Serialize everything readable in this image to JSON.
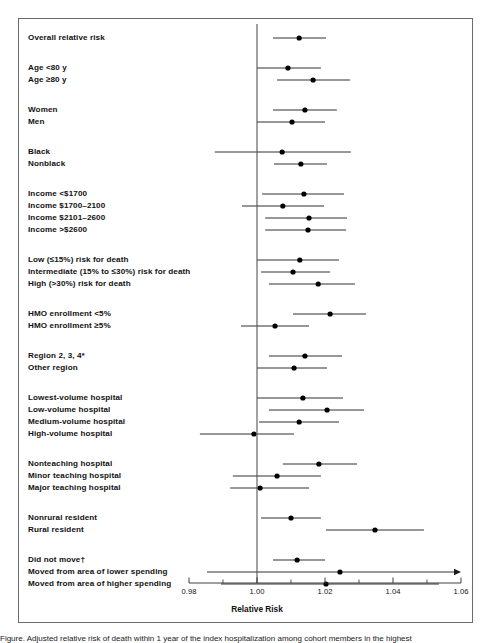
{
  "figure": {
    "x_axis_title": "Relative Risk",
    "x_ticks": [
      "0.98",
      "1.00",
      "1.02",
      "1.04",
      "1.06"
    ],
    "x_tick_values": [
      0.98,
      1.0,
      1.02,
      1.04,
      1.06
    ],
    "x_minor_ticks": [
      0.99,
      1.01,
      1.03,
      1.05
    ],
    "reference_line": 1.0,
    "caption_partial": "Figure. Adjusted relative risk of death within 1 year of the index hospitalization among cohort members in the highest"
  },
  "chart_data": {
    "type": "forest",
    "title": "",
    "xlabel": "Relative Risk",
    "ylabel": "",
    "xlim": [
      0.98,
      1.06
    ],
    "grid": false,
    "reference_line": 1.0,
    "measure": "Relative Risk",
    "groups": [
      {
        "name": "overall",
        "rows": [
          {
            "label": "Overall relative risk",
            "rr": 1.0124,
            "ci_low": 1.0047,
            "ci_high": 1.0203,
            "arrow_right": false
          }
        ]
      },
      {
        "name": "age",
        "rows": [
          {
            "label": "Age <80 y",
            "rr": 1.0091,
            "ci_low": 1.0,
            "ci_high": 1.0188,
            "arrow_right": false
          },
          {
            "label": "Age ≥80 y",
            "rr": 1.0165,
            "ci_low": 1.0059,
            "ci_high": 1.0274,
            "arrow_right": false
          }
        ]
      },
      {
        "name": "sex",
        "rows": [
          {
            "label": "Women",
            "rr": 1.0141,
            "ci_low": 1.0047,
            "ci_high": 1.0235,
            "arrow_right": false
          },
          {
            "label": "Men",
            "rr": 1.0103,
            "ci_low": 1.0,
            "ci_high": 1.02,
            "arrow_right": false
          }
        ]
      },
      {
        "name": "race",
        "rows": [
          {
            "label": "Black",
            "rr": 1.0074,
            "ci_low": 0.9876,
            "ci_high": 1.0276,
            "arrow_right": false
          },
          {
            "label": "Nonblack",
            "rr": 1.0129,
            "ci_low": 1.005,
            "ci_high": 1.0206,
            "arrow_right": false
          }
        ]
      },
      {
        "name": "income",
        "rows": [
          {
            "label": "Income <$1700",
            "rr": 1.0138,
            "ci_low": 1.0015,
            "ci_high": 1.0256,
            "arrow_right": false
          },
          {
            "label": "Income $1700–2100",
            "rr": 1.0076,
            "ci_low": 0.9956,
            "ci_high": 1.0197,
            "arrow_right": false
          },
          {
            "label": "Income $2101–2600",
            "rr": 1.0153,
            "ci_low": 1.0024,
            "ci_high": 1.0265,
            "arrow_right": false
          },
          {
            "label": "Income >$2600",
            "rr": 1.015,
            "ci_low": 1.0024,
            "ci_high": 1.0262,
            "arrow_right": false
          }
        ]
      },
      {
        "name": "risk-for-death",
        "rows": [
          {
            "label": "Low (≤15%) risk for death",
            "rr": 1.0126,
            "ci_low": 1.0,
            "ci_high": 1.0241,
            "arrow_right": false
          },
          {
            "label": "Intermediate (15% to ≤30%) risk for death",
            "rr": 1.0106,
            "ci_low": 1.0012,
            "ci_high": 1.0215,
            "arrow_right": false
          },
          {
            "label": "High (>30%) risk for death",
            "rr": 1.018,
            "ci_low": 1.0035,
            "ci_high": 1.0288,
            "arrow_right": false
          }
        ]
      },
      {
        "name": "hmo-enrollment",
        "rows": [
          {
            "label": "HMO enrollment <5%",
            "rr": 1.0215,
            "ci_low": 1.0106,
            "ci_high": 1.0321,
            "arrow_right": false
          },
          {
            "label": "HMO enrollment ≥5%",
            "rr": 1.0053,
            "ci_low": 0.9953,
            "ci_high": 1.0153,
            "arrow_right": false
          }
        ]
      },
      {
        "name": "region",
        "rows": [
          {
            "label": "Region 2, 3, 4*",
            "rr": 1.0141,
            "ci_low": 1.0035,
            "ci_high": 1.025,
            "arrow_right": false
          },
          {
            "label": "Other region",
            "rr": 1.0109,
            "ci_low": 1.0,
            "ci_high": 1.0206,
            "arrow_right": false
          }
        ]
      },
      {
        "name": "hospital-volume",
        "rows": [
          {
            "label": "Lowest-volume hospital",
            "rr": 1.0135,
            "ci_low": 1.0,
            "ci_high": 1.0253,
            "arrow_right": false
          },
          {
            "label": "Low-volume hospital",
            "rr": 1.0206,
            "ci_low": 1.0035,
            "ci_high": 1.0315,
            "arrow_right": false
          },
          {
            "label": "Medium-volume hospital",
            "rr": 1.0124,
            "ci_low": 1.0006,
            "ci_high": 1.0241,
            "arrow_right": false
          },
          {
            "label": "High-volume hospital",
            "rr": 0.9991,
            "ci_low": 0.9832,
            "ci_high": 1.0109,
            "arrow_right": false
          }
        ]
      },
      {
        "name": "teaching-status",
        "rows": [
          {
            "label": "Nonteaching hospital",
            "rr": 1.0182,
            "ci_low": 1.0076,
            "ci_high": 1.0294,
            "arrow_right": false
          },
          {
            "label": "Minor teaching hospital",
            "rr": 1.0059,
            "ci_low": 0.9929,
            "ci_high": 1.0188,
            "arrow_right": false
          },
          {
            "label": "Major teaching hospital",
            "rr": 1.0009,
            "ci_low": 0.9921,
            "ci_high": 1.0153,
            "arrow_right": false
          }
        ]
      },
      {
        "name": "residence",
        "rows": [
          {
            "label": "Nonrural resident",
            "rr": 1.01,
            "ci_low": 1.0012,
            "ci_high": 1.0188,
            "arrow_right": false
          },
          {
            "label": "Rural resident",
            "rr": 1.0347,
            "ci_low": 1.0203,
            "ci_high": 1.0491,
            "arrow_right": false
          }
        ]
      },
      {
        "name": "migration",
        "rows": [
          {
            "label": "Did not move†",
            "rr": 1.0118,
            "ci_low": 1.0047,
            "ci_high": 1.02,
            "arrow_right": false
          },
          {
            "label": "Moved from area of lower spending",
            "rr": 1.0244,
            "ci_low": 0.9853,
            "ci_high": 1.06,
            "arrow_right": true
          },
          {
            "label": "Moved from area of higher spending",
            "rr": 1.0203,
            "ci_low": 0.9894,
            "ci_high": 1.0535,
            "arrow_right": false
          }
        ]
      }
    ]
  },
  "colors": {
    "marker": "#000000",
    "line": "#1a1a1a",
    "axis": "#2b2b2b",
    "reference": "#555555",
    "frame": "#6b6b6b",
    "background": "#ffffff"
  }
}
